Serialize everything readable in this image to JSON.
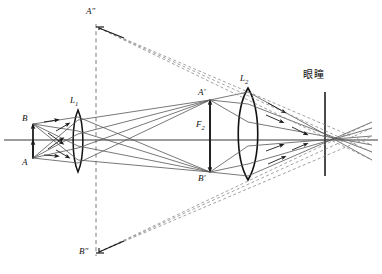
{
  "figure": {
    "type": "optical-ray-diagram",
    "width": 382,
    "height": 274,
    "background_color": "#ffffff",
    "ink_color": "#1a1a1a",
    "ray_color": "#555555",
    "dashed_color": "#7a7a7a"
  },
  "labels": {
    "object_top": "B",
    "object_bottom": "A",
    "objective_lens": "L",
    "objective_lens_sub": "1",
    "eyepiece_lens": "L",
    "eyepiece_lens_sub": "2",
    "intermediate_image_top": "A′",
    "intermediate_image_bottom": "B′",
    "focal_point": "F",
    "focal_point_sub": "2",
    "virtual_image_top": "A″",
    "virtual_image_bottom": "B″",
    "pupil": "眼瞳"
  },
  "geometry": {
    "axis": {
      "y": 140,
      "x_start": 4,
      "x_end": 378
    },
    "object": {
      "x": 33,
      "top_y": 124,
      "bottom_y": 158
    },
    "lens_1": {
      "cx": 78,
      "top_y": 110,
      "bottom_y": 172,
      "half_width": 7
    },
    "lens_2": {
      "cx": 248,
      "top_y": 88,
      "bottom_y": 180,
      "half_width": 14
    },
    "dashed_vertical": {
      "x": 96,
      "top_y": 24,
      "bottom_y": 256
    },
    "intermediate_image": {
      "x": 210,
      "top_y": 100,
      "bottom_y": 172
    },
    "virtual_image": {
      "x": 99,
      "top_y": 26,
      "bottom_y": 253
    },
    "pupil": {
      "x": 325,
      "top_y": 92,
      "bottom_y": 176
    }
  },
  "label_positions": {
    "object_top": {
      "x": 22,
      "y": 114
    },
    "object_bottom": {
      "x": 22,
      "y": 158
    },
    "objective_lens": {
      "x": 70,
      "y": 98
    },
    "eyepiece_lens": {
      "x": 240,
      "y": 76
    },
    "intermediate_image_top": {
      "x": 199,
      "y": 90
    },
    "intermediate_image_bottom": {
      "x": 199,
      "y": 175
    },
    "focal_point": {
      "x": 196,
      "y": 122
    },
    "virtual_image_top": {
      "x": 87,
      "y": 8
    },
    "virtual_image_bottom": {
      "x": 80,
      "y": 248
    },
    "pupil": {
      "x": 303,
      "y": 73
    }
  }
}
